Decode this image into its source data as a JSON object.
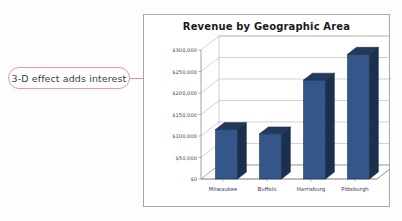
{
  "annotation": {
    "text": "3-D effect adds interest",
    "border_color": "#e09aaa",
    "line_color": "#e4909f"
  },
  "chart_data": {
    "type": "bar",
    "title": "Revenue by Geographic Area",
    "categories": [
      "Milwaukee",
      "Buffalo",
      "Harrisburg",
      "Pittsburgh"
    ],
    "values": [
      115000,
      105000,
      230000,
      290000
    ],
    "series": [
      {
        "name": "Revenue",
        "values": [
          115000,
          105000,
          230000,
          290000
        ]
      }
    ],
    "xlabel": "",
    "ylabel": "",
    "ylim": [
      0,
      300000
    ],
    "ytick_values": [
      0,
      50000,
      100000,
      150000,
      200000,
      250000,
      300000
    ],
    "ytick_labels": [
      "$0",
      "$50,000",
      "$100,000",
      "$150,000",
      "$200,000",
      "$250,000",
      "$300,000"
    ],
    "grid": true,
    "legend": "none",
    "three_d": true,
    "bar_color_front": "#34568b",
    "bar_color_side": "#1b2f4f",
    "bar_color_top": "#22395e",
    "axis_color": "#8c8c8c",
    "gridline_color": "#b4b4b4",
    "title_color": "#1a1a1a"
  }
}
